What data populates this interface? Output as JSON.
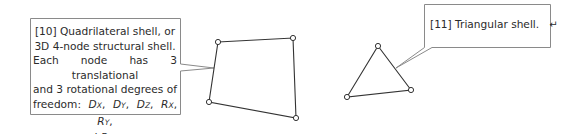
{
  "diagram": {
    "quad_callout": {
      "lines": [
        "[10] Quadrilateral shell, or",
        "3D 4-node structural shell.",
        "Each node has 3 translational",
        "and 3 rotational degrees of"
      ],
      "freedom_prefix": "freedom: ",
      "dofs": [
        {
          "base": "D",
          "sub": "X"
        },
        {
          "base": "D",
          "sub": "Y"
        },
        {
          "base": "D",
          "sub": "Z"
        },
        {
          "base": "R",
          "sub": "X"
        },
        {
          "base": "R",
          "sub": "Y"
        },
        {
          "base": "R",
          "sub": "Z"
        }
      ],
      "and_word": "and ",
      "arrow_glyph": "→"
    },
    "tri_callout": {
      "text": "[11] Triangular shell.",
      "return_glyph": "↵"
    },
    "quad_nodes": [
      [
        218,
        42
      ],
      [
        293,
        38
      ],
      [
        296,
        118
      ],
      [
        209,
        102
      ]
    ],
    "tri_nodes": [
      [
        378,
        46
      ],
      [
        411,
        90
      ],
      [
        347,
        97
      ]
    ],
    "colors": {
      "line": "#333333",
      "box_border": "#8a8a8a",
      "node_fill": "#ffffff"
    }
  }
}
